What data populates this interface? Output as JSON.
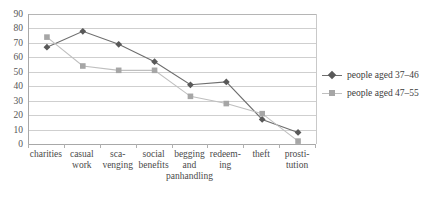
{
  "chart_data": {
    "type": "line",
    "title": "",
    "xlabel": "",
    "ylabel": "",
    "ylim": [
      0,
      90
    ],
    "ytick_step": 10,
    "grid": true,
    "legend_position": "right",
    "categories": [
      "charities",
      "casual\nwork",
      "sca-\nvenging",
      "social\nbenefits",
      "begging\nand\npanhandling",
      "redeem-\ning",
      "theft",
      "prosti-\ntution"
    ],
    "ytick_labels": [
      "90",
      "80",
      "70",
      "60",
      "50",
      "40",
      "30",
      "20",
      "10",
      "0"
    ],
    "series": [
      {
        "name": "people aged 37-46",
        "marker": "diamond",
        "color": "#595959",
        "line_color": "#6e6e6e",
        "values": [
          67,
          78,
          69,
          57,
          41,
          43,
          17,
          8
        ]
      },
      {
        "name": "people aged 47-55",
        "marker": "square",
        "color": "#a6a6a6",
        "line_color": "#bfbfbf",
        "values": [
          74,
          54,
          51,
          51,
          33,
          28,
          21,
          2
        ]
      }
    ]
  },
  "legend": {
    "entries": [
      {
        "label": "people aged 37–46"
      },
      {
        "label": "people aged 47–55"
      }
    ]
  },
  "colors": {
    "series_1": "#595959",
    "series_2": "#a6a6a6",
    "gridline": "#cfcfcf",
    "axis": "#a8a8a8",
    "background": "#ffffff",
    "text": "#4a4a4a"
  }
}
